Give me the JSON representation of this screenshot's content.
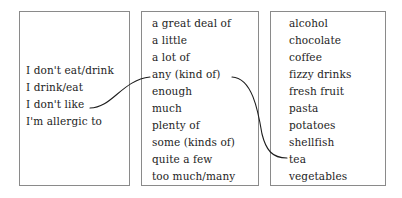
{
  "diagram": {
    "type": "substitution-table",
    "background_color": "#ffffff",
    "border_color": "#8a8a8a",
    "text_color": "#1d1d1d",
    "columns": [
      {
        "name": "phrases",
        "items": [
          "I don't eat/drink",
          "I drink/eat",
          "I don't like",
          "I'm allergic to"
        ]
      },
      {
        "name": "quantifiers",
        "items": [
          "a great deal of",
          "a little",
          "a lot of",
          "any (kind of)",
          "enough",
          "much",
          "plenty of",
          "some (kinds of)",
          "quite a few",
          "too much/many"
        ]
      },
      {
        "name": "foods",
        "items": [
          "alcohol",
          "chocolate",
          "coffee",
          "fizzy drinks",
          "fresh fruit",
          "pasta",
          "potatoes",
          "shellfish",
          "tea",
          "vegetables"
        ]
      }
    ],
    "connectors": [
      {
        "name": "connector-dont-like-to-any",
        "from_item": "I don't like",
        "to_item": "any (kind of)"
      },
      {
        "name": "connector-any-to-tea",
        "from_item": "any (kind of)",
        "to_item": "tea"
      }
    ]
  }
}
